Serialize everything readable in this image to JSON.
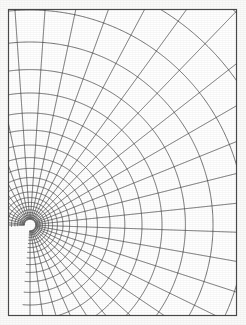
{
  "figure": {
    "title": "Orthogonal net of field lines and equipotentials about a single pole",
    "kind": "conformal-grid",
    "background_color": "#fbfbfa",
    "paper_color": "#ffffff",
    "line_color": "#3d3d3d",
    "frame_color": "#4a4a4a",
    "frame": {
      "x": 8.5,
      "y": 9.5,
      "width": 228,
      "height": 306,
      "stroke_width": 1.15
    },
    "singularity": {
      "label": "pole",
      "x": 30,
      "y": 225,
      "hole_radius": 5.2
    },
    "line_width": 0.72
  },
  "chart_data": {
    "type": "line",
    "title": "Orthogonal net of field lines and equipotentials about a single pole",
    "xlabel": "",
    "ylabel": "",
    "grid": false,
    "legend": "none",
    "coordinate_system": "polar",
    "origin": {
      "x": 30,
      "y": 225
    },
    "clip_box": {
      "x": 8.5,
      "y": 9.5,
      "width": 228,
      "height": 306
    },
    "equipotential_radii": [
      6.4,
      8.0,
      10.0,
      12.4,
      15.2,
      18.6,
      22.6,
      27.4,
      33.0,
      39.6,
      47.4,
      56.6,
      67.4,
      80.0,
      94.8,
      112.0,
      132.0,
      155.4,
      183.0,
      215.0,
      252.0,
      296.0,
      347.0
    ],
    "field_line_angles_deg": [
      -90,
      -82,
      -74,
      -66,
      -58,
      -50,
      -42,
      -34,
      -26,
      -18,
      -10,
      -2,
      6,
      14,
      22,
      30,
      38,
      46,
      54,
      62,
      70,
      78,
      86,
      94,
      102,
      110,
      118,
      126,
      134,
      142,
      150,
      158,
      166,
      174,
      180
    ],
    "series": [
      {
        "name": "equipotentials",
        "role": "concentric-arcs",
        "count": 23
      },
      {
        "name": "field-lines",
        "role": "radial-rays",
        "count": 35
      }
    ]
  }
}
